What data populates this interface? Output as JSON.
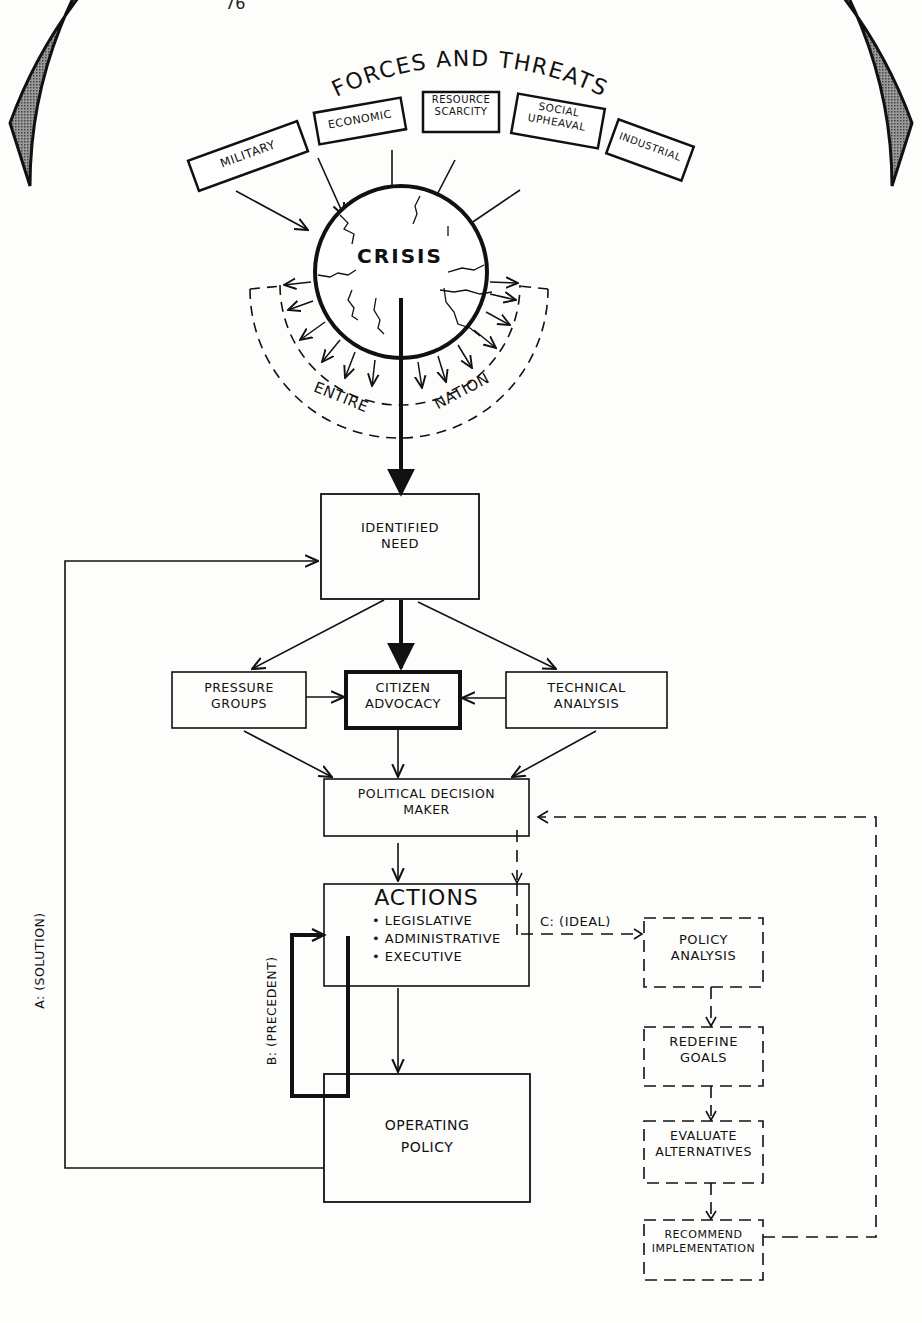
{
  "page": {
    "number": "76"
  },
  "arc": {
    "title": "FORCES AND THREATS",
    "items": [
      "MILITARY",
      "ECONOMIC",
      "RESOURCE SCARCITY",
      "SOCIAL UPHEAVAL",
      "INDUSTRIAL"
    ]
  },
  "crisis": {
    "label": "CRISIS",
    "left_label": "ENTIRE",
    "right_label": "NATION"
  },
  "nodes": {
    "identified_need": [
      "IDENTIFIED",
      "NEED"
    ],
    "pressure_groups": [
      "PRESSURE",
      "GROUPS"
    ],
    "citizen_advocacy": [
      "CITIZEN",
      "ADVOCACY"
    ],
    "technical_analysis": [
      "TECHNICAL",
      "ANALYSIS"
    ],
    "political_decision_maker": [
      "POLITICAL DECISION",
      "MAKER"
    ],
    "actions": {
      "title": "ACTIONS",
      "bullets": [
        "LEGISLATIVE",
        "ADMINISTRATIVE",
        "EXECUTIVE"
      ]
    },
    "operating_policy": [
      "OPERATING",
      "POLICY"
    ],
    "policy_analysis": [
      "POLICY",
      "ANALYSIS"
    ],
    "redefine_goals": [
      "REDEFINE",
      "GOALS"
    ],
    "evaluate_alternatives": [
      "EVALUATE",
      "ALTERNATIVES"
    ],
    "recommend_implementation": [
      "RECOMMEND",
      "IMPLEMENTATION"
    ]
  },
  "paths": {
    "a": "A: (SOLUTION)",
    "b": "B: (PRECEDENT)",
    "c": "C: (IDEAL)"
  }
}
